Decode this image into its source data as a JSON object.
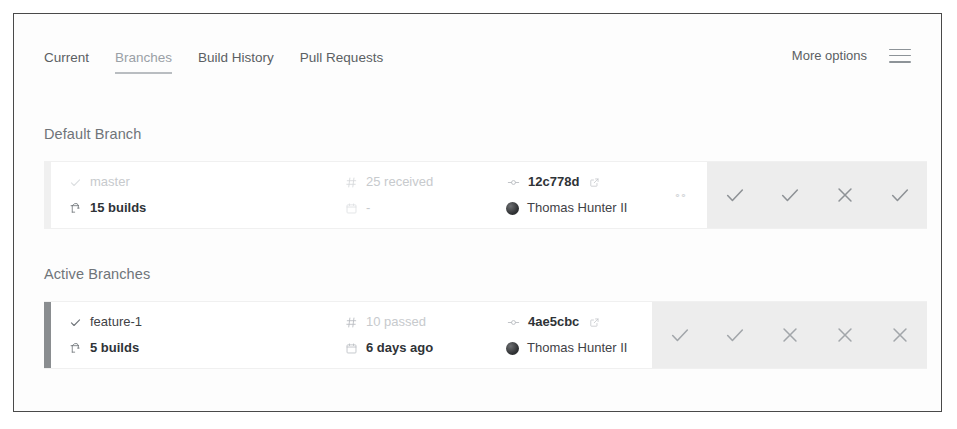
{
  "window": {
    "title": "Branches"
  },
  "tabs": [
    {
      "label": "Current",
      "active": false
    },
    {
      "label": "Branches",
      "active": true
    },
    {
      "label": "Build History",
      "active": false
    },
    {
      "label": "Pull Requests",
      "active": false
    }
  ],
  "toolbar": {
    "more_options_label": "More options",
    "menu_icon": "hamburger-icon"
  },
  "sections": [
    {
      "title": "Default Branch",
      "row": {
        "branch_name": "master",
        "branch_status_icon": "check-icon",
        "builds_label": "15 builds",
        "builds_icon": "crane-icon",
        "build_count_label": "25 received",
        "build_count_icon": "hash-icon",
        "date_label": "-",
        "date_icon": "calendar-icon",
        "commit_hash": "12c778d",
        "commit_icon": "git-commit-icon",
        "external_link_icon": "external-link-icon",
        "author": "Thomas Hunter II",
        "avatar_icon": "avatar",
        "bar_color": "#f0f0f0",
        "dimmed": true,
        "statuses": [
          "pending",
          "pass",
          "pass",
          "fail",
          "pass"
        ]
      }
    },
    {
      "title": "Active Branches",
      "row": {
        "branch_name": "feature-1",
        "branch_status_icon": "check-icon",
        "builds_label": "5 builds",
        "builds_icon": "crane-icon",
        "build_count_label": "10 passed",
        "build_count_icon": "hash-icon",
        "date_label": "6 days ago",
        "date_icon": "calendar-icon",
        "commit_hash": "4ae5cbc",
        "commit_icon": "git-commit-icon",
        "external_link_icon": "external-link-icon",
        "author": "Thomas Hunter II",
        "avatar_icon": "avatar",
        "bar_color": "#8a8d90",
        "dimmed": false,
        "statuses": [
          "pass",
          "pass",
          "fail",
          "fail",
          "fail"
        ]
      }
    }
  ],
  "colors": {
    "border": "#4a4a4a",
    "tile": "#ededed",
    "mark": "#9aa0a6",
    "text": "#2f3337",
    "muted": "#c7cacd"
  }
}
